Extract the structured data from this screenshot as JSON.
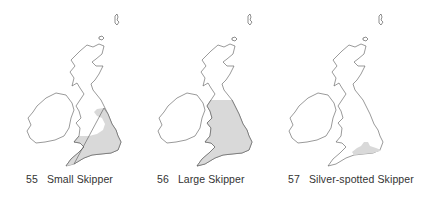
{
  "colors": {
    "range_fill": "#d9d9d9",
    "coastline": "#555555",
    "background": "#ffffff",
    "caption_text": "#333333"
  },
  "maps": [
    {
      "number": "55",
      "species": "Small Skipper",
      "range_description": "England and Wales, excluding northern England and a gap in north-west England"
    },
    {
      "number": "56",
      "species": "Large Skipper",
      "range_description": "England and Wales up to northern England"
    },
    {
      "number": "57",
      "species": "Silver-spotted Skipper",
      "range_description": "Restricted to southern England chalk downs"
    }
  ]
}
